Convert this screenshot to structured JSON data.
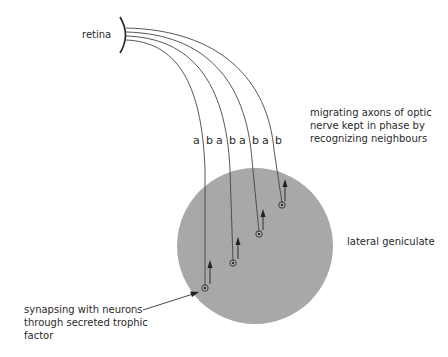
{
  "diagram": {
    "labels": {
      "retina": "retina",
      "migrating": [
        "migrating axons of optic",
        "nerve kept in phase by",
        "recognizing neighbours"
      ],
      "lateral_geniculate": "lateral geniculate",
      "synapsing": [
        "synapsing with neurons",
        "through secreted trophic",
        "factor"
      ]
    },
    "axon_labels": [
      {
        "a": "a",
        "b": "b"
      },
      {
        "a": "a",
        "b": "b"
      },
      {
        "a": "a",
        "b": "b"
      },
      {
        "a": "a",
        "b": "b"
      }
    ],
    "colors": {
      "nucleus_fill": "#a8a8a8",
      "line": "#444444",
      "text": "#2a2a2a"
    }
  }
}
